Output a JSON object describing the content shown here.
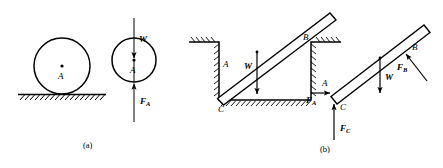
{
  "figure": {
    "title": "",
    "captions": {
      "a": "(a)",
      "b": "(b)"
    },
    "stroke_color": "#000000",
    "background_color": "#ffffff"
  },
  "panel_a": {
    "caption": "(a)",
    "space_diagram": {
      "body": "circle",
      "center_label": "A",
      "support": "hatched-ground"
    },
    "free_body_diagram": {
      "body": "circle",
      "center_label": "A",
      "forces": [
        {
          "symbol": "W",
          "sub": "",
          "direction": "down",
          "applied_at": "center"
        },
        {
          "symbol": "F",
          "sub": "A",
          "direction": "up",
          "applied_at": "bottom-contact"
        }
      ]
    }
  },
  "panel_b": {
    "caption": "(b)",
    "space_diagram": {
      "body": "bar",
      "points": [
        "A",
        "B",
        "C"
      ],
      "support": "trench-with-hatched-walls",
      "forces": [
        {
          "symbol": "W",
          "sub": "",
          "direction": "down",
          "applied_at": "midpoint"
        }
      ]
    },
    "free_body_diagram": {
      "body": "bar",
      "points": [
        "A",
        "B",
        "C"
      ],
      "forces": [
        {
          "symbol": "F",
          "sub": "A",
          "direction": "right",
          "applied_at": "A"
        },
        {
          "symbol": "F",
          "sub": "C",
          "direction": "up",
          "applied_at": "C"
        },
        {
          "symbol": "W",
          "sub": "",
          "direction": "down",
          "applied_at": "midpoint"
        },
        {
          "symbol": "F",
          "sub": "B",
          "direction": "up-left-normal",
          "applied_at": "B"
        }
      ]
    }
  }
}
